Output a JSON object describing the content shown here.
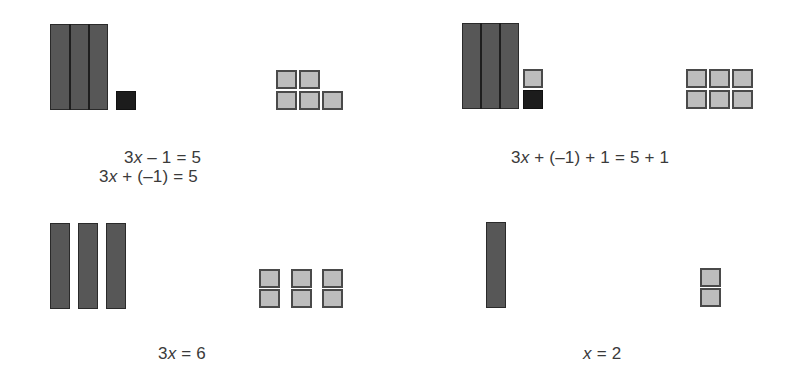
{
  "diagram": {
    "colors": {
      "x_tile": "#575757",
      "positive_unit": "#bdbdbd",
      "negative_unit": "#1c1c1c",
      "arrow": "#a8a8a8",
      "line": "#555555"
    },
    "panels": [
      {
        "id": "step-1",
        "left_pan": {
          "x_tiles": 3,
          "x_tiles_joined": true,
          "negative_units": 1,
          "positive_units": 0
        },
        "right_pan": {
          "positive_units": 5
        },
        "equations": [
          {
            "coef": "3",
            "var": "x",
            "rest": " – 1 = 5"
          },
          {
            "coef": "3",
            "var": "x",
            "rest": " + (–1) = 5"
          }
        ]
      },
      {
        "id": "step-2",
        "left_pan": {
          "x_tiles": 3,
          "x_tiles_joined": true,
          "negative_units": 1,
          "positive_units": 1
        },
        "right_pan": {
          "positive_units": 6
        },
        "equations": [
          {
            "coef": "3",
            "var": "x",
            "rest": " + (–1) + 1 = 5 + 1"
          }
        ]
      },
      {
        "id": "step-3",
        "left_pan": {
          "x_tiles": 3,
          "x_tiles_joined": false,
          "negative_units": 0,
          "positive_units": 0
        },
        "right_pan": {
          "positive_units": 6
        },
        "equations": [
          {
            "coef": "3",
            "var": "x",
            "rest": " = 6"
          }
        ]
      },
      {
        "id": "step-4",
        "left_pan": {
          "x_tiles": 1,
          "negative_units": 0,
          "positive_units": 0
        },
        "right_pan": {
          "positive_units": 2
        },
        "equations": [
          {
            "coef": "",
            "var": "x",
            "rest": " = 2"
          }
        ]
      }
    ],
    "arrows": [
      {
        "from": "step-1",
        "to": "step-2",
        "icon": "right-arrow-icon"
      },
      {
        "from": "step-3",
        "to": "step-4",
        "icon": "right-arrow-icon"
      }
    ]
  }
}
